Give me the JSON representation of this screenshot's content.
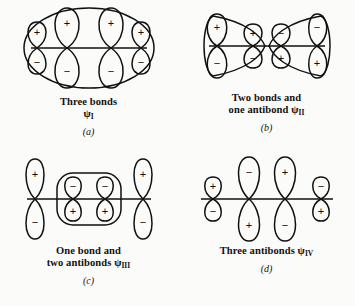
{
  "figure": {
    "ink_color": "#111111",
    "background_color": "#fbfbfa"
  },
  "panels": [
    {
      "id": "a",
      "label": "(a)",
      "caption_line1": "Three bonds",
      "caption_line2": "",
      "psi": "ψ",
      "psi_subscript": "I",
      "node_count": 0,
      "orbital_signs_top": [
        "+",
        "+",
        "+",
        "+"
      ],
      "orbital_signs_bottom": [
        "−",
        "−",
        "−",
        "−"
      ],
      "orbital_sizes": [
        "small",
        "large",
        "large",
        "small"
      ],
      "envelope": "full-oval"
    },
    {
      "id": "b",
      "label": "(b)",
      "caption_line1": "Two bonds and",
      "caption_line2": "one antibond",
      "psi": "ψ",
      "psi_subscript": "II",
      "node_count": 1,
      "orbital_signs_top": [
        "+",
        "+",
        "−",
        "−"
      ],
      "orbital_signs_bottom": [
        "−",
        "−",
        "+",
        "+"
      ],
      "orbital_sizes": [
        "large",
        "small",
        "small",
        "large"
      ],
      "envelope": "bowtie"
    },
    {
      "id": "c",
      "label": "(c)",
      "caption_line1": "One bond and",
      "caption_line2": "two antibonds",
      "psi": "ψ",
      "psi_subscript": "III",
      "node_count": 2,
      "orbital_signs_top": [
        "+",
        "−",
        "−",
        "+"
      ],
      "orbital_signs_bottom": [
        "−",
        "+",
        "+",
        "−"
      ],
      "orbital_sizes": [
        "tall",
        "short",
        "short",
        "tall"
      ],
      "envelope": "inner-rounded-rect"
    },
    {
      "id": "d",
      "label": "(d)",
      "caption_line1": "Three antibonds",
      "caption_line2": "",
      "psi": "ψ",
      "psi_subscript": "IV",
      "node_count": 3,
      "orbital_signs_top": [
        "+",
        "−",
        "+",
        "−"
      ],
      "orbital_signs_bottom": [
        "−",
        "+",
        "−",
        "+"
      ],
      "orbital_sizes": [
        "small",
        "tall",
        "tall",
        "small"
      ],
      "envelope": "none"
    }
  ]
}
